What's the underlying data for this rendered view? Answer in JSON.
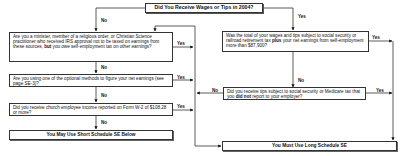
{
  "title": "Did You Receive Wages or Tips in 2004?",
  "left_branch": {
    "label": "No",
    "questions": [
      {
        "id": "minister",
        "text_parts": [
          "Are you a minister, member of a religious order, or Christian Science practitioner who received IRS approval not to be taxed on earnings from these sources, ",
          "but",
          " you owe self-employment tax on other earnings?"
        ],
        "yes_label": "Yes",
        "no_label": "No"
      },
      {
        "id": "optional-methods",
        "text": "Are you using one of the optional methods to figure your net earnings (see page SE-3)?",
        "yes_label": "Yes",
        "no_label": "No"
      },
      {
        "id": "church-income",
        "text": "Did you receive church employee income reported on Form W-2 of $108.28 or more?",
        "yes_label": "Yes",
        "no_label": "No"
      }
    ],
    "result": "You May Use Short Schedule SE Below"
  },
  "right_branch": {
    "label": "Yes",
    "questions": [
      {
        "id": "wages-total",
        "text_parts": [
          "Was the total of your wages and tips subject to social security or railroad retirement tax ",
          "plus",
          " your net earnings from self-employment more than $87,900?"
        ],
        "yes_label": "Yes",
        "no_label": "No"
      },
      {
        "id": "unreported-tips",
        "text_parts": [
          "Did you receive tips subject to social security or Medicare tax that you ",
          "did not",
          " report to your employer?"
        ],
        "yes_label": "Yes",
        "no_label": "No"
      }
    ],
    "result": "You Must Use Long Schedule SE"
  }
}
